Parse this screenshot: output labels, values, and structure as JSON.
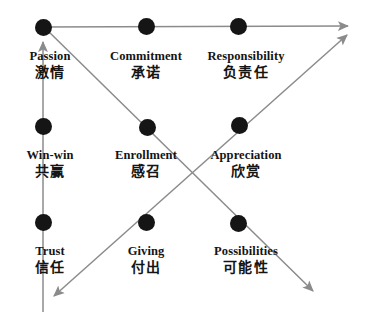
{
  "diagram": {
    "background_color": "#ffffff",
    "node_color": "#151515",
    "line_color": "#8b8b8b",
    "text_color": "#141414",
    "nodes": [
      {
        "id": "passion",
        "en": "Passion",
        "zh": "激情",
        "x": 43,
        "y": 27,
        "label_x": 50,
        "label_y": 50
      },
      {
        "id": "commitment",
        "en": "Commitment",
        "zh": "承诺",
        "x": 146,
        "y": 26,
        "label_x": 146,
        "label_y": 50
      },
      {
        "id": "responsibility",
        "en": "Responsibility",
        "zh": "负责任",
        "x": 238,
        "y": 26,
        "label_x": 246,
        "label_y": 50
      },
      {
        "id": "winwin",
        "en": "Win-win",
        "zh": "共赢",
        "x": 43,
        "y": 126,
        "label_x": 50,
        "label_y": 149
      },
      {
        "id": "enrollment",
        "en": "Enrollment",
        "zh": "感召",
        "x": 147,
        "y": 127,
        "label_x": 146,
        "label_y": 149
      },
      {
        "id": "appreciation",
        "en": "Appreciation",
        "zh": "欣赏",
        "x": 239,
        "y": 125,
        "label_x": 246,
        "label_y": 149
      },
      {
        "id": "trust",
        "en": "Trust",
        "zh": "信任",
        "x": 43,
        "y": 222,
        "label_x": 50,
        "label_y": 245
      },
      {
        "id": "giving",
        "en": "Giving",
        "zh": "付出",
        "x": 146,
        "y": 222,
        "label_x": 146,
        "label_y": 245
      },
      {
        "id": "possibilities",
        "en": "Possibilities",
        "zh": "可能性",
        "x": 238,
        "y": 223,
        "label_x": 246,
        "label_y": 245
      }
    ],
    "arrows": [
      {
        "id": "horizontal-top",
        "from": [
          40,
          27
        ],
        "to": [
          352,
          26
        ],
        "head": "end"
      },
      {
        "id": "vertical-left",
        "from": [
          43,
          312
        ],
        "to": [
          43,
          38
        ],
        "head": "end"
      },
      {
        "id": "diagonal-descending",
        "from": [
          45,
          28
        ],
        "to": [
          317,
          294
        ],
        "head": "end"
      },
      {
        "id": "diagonal-ascending",
        "from": [
          50,
          300
        ],
        "to": [
          351,
          32
        ],
        "head": "both"
      }
    ]
  }
}
